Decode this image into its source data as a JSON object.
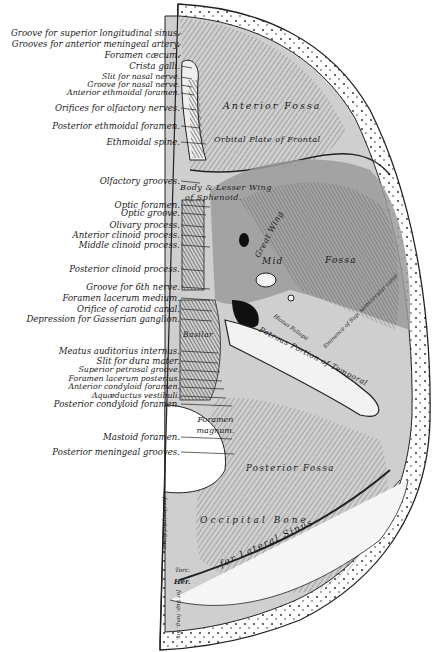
{
  "figure": {
    "left_labels": [
      {
        "text": "Groove for superior longitudinal sinus.",
        "y": 33
      },
      {
        "text": "Grooves for anterior meningeal artery.",
        "y": 44
      },
      {
        "text": "Foramen cæcum.",
        "y": 55
      },
      {
        "text": "Crista galli.",
        "y": 66
      },
      {
        "text": "Slit for nasal nerve.",
        "y": 77,
        "small": true
      },
      {
        "text": "Groove for nasal nerve.",
        "y": 85,
        "small": true
      },
      {
        "text": "Anterior ethmoidal foramen.",
        "y": 93,
        "small": true
      },
      {
        "text": "Orifices for olfactory nerves.",
        "y": 108
      },
      {
        "text": "Posterior ethmoidal foramen.",
        "y": 126
      },
      {
        "text": "Ethmoidal spine.",
        "y": 142
      },
      {
        "text": "Olfactory grooves.",
        "y": 181
      },
      {
        "text": "Optic foramen.",
        "y": 205
      },
      {
        "text": "Optic groove.",
        "y": 213
      },
      {
        "text": "Olivary process.",
        "y": 225
      },
      {
        "text": "Anterior clinoid process.",
        "y": 235
      },
      {
        "text": "Middle clinoid process.",
        "y": 245
      },
      {
        "text": "Posterior clinoid process.",
        "y": 269
      },
      {
        "text": "Groove for 6th nerve.",
        "y": 287
      },
      {
        "text": "Foramen lacerum medium.",
        "y": 298
      },
      {
        "text": "Orifice of carotid canal.",
        "y": 309
      },
      {
        "text": "Depression for Gasserian ganglion.",
        "y": 319
      },
      {
        "text": "Meatus auditorius internus.",
        "y": 351
      },
      {
        "text": "Slit for dura mater.",
        "y": 361
      },
      {
        "text": "Superior petrosal groove.",
        "y": 370,
        "small": true
      },
      {
        "text": "Foramen lacerum posterius.",
        "y": 379,
        "small": true
      },
      {
        "text": "Anterior condyloid foramen.",
        "y": 387,
        "small": true
      },
      {
        "text": "Aquæductus vestibuli.",
        "y": 396,
        "small": true
      },
      {
        "text": "Posterior condyloid foramen.",
        "y": 404
      },
      {
        "text": "Mastoid foramen.",
        "y": 437
      },
      {
        "text": "Posterior meningeal grooves.",
        "y": 452
      }
    ],
    "region_labels": {
      "anterior_fossa": "Anterior Fossa",
      "orbital_plate": "Orbital Plate of Frontal",
      "body_lesser_wing": "Body & Lesser Wing",
      "of_sphenoid": "of Sphenoid.",
      "great_wing": "Great Wing",
      "middle_fossa_1": "Mid",
      "middle_fossa_2": "Fossa",
      "petrous": "Petrous Portion of Temporal",
      "hiatus": "Hiatus Fallopii",
      "eminence": "Eminence of Sup. semicircular canal",
      "basilar": "Basilar",
      "foramen_magnum": "Foramen magnum.",
      "posterior_fossa": "Posterior Fossa",
      "occipital": "Occipital Bone",
      "lateral_sinus": "for Lateral Sinus",
      "occipital_sinus": "for Occipital Sinus",
      "torcular": "Torc.",
      "herophili": "Her.",
      "sup_long_sinus": "for Sup. long. Sin."
    }
  }
}
